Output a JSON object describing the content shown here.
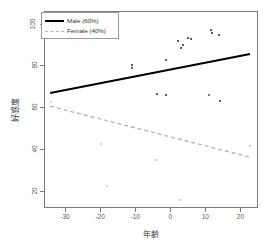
{
  "chart_data": {
    "type": "scatter",
    "title": "",
    "xlabel": "年齢",
    "ylabel": "好感度",
    "xlim": [
      -36,
      25
    ],
    "ylim": [
      12,
      106
    ],
    "xticks": [
      -30,
      -20,
      -10,
      0,
      10,
      20
    ],
    "yticks": [
      20,
      40,
      60,
      80,
      100
    ],
    "grid": false,
    "legend_position": "top-left",
    "series": [
      {
        "name": "Male (60%)",
        "color": "#000000",
        "linestyle": "solid",
        "points": [
          {
            "x": -11.2,
            "y": 80.6
          },
          {
            "x": -11.2,
            "y": 79.4
          },
          {
            "x": -4.0,
            "y": 67.0
          },
          {
            "x": -1.6,
            "y": 66.2
          },
          {
            "x": -1.4,
            "y": 83.2
          },
          {
            "x": 2.0,
            "y": 92.0
          },
          {
            "x": 2.8,
            "y": 88.8
          },
          {
            "x": 3.2,
            "y": 90.4
          },
          {
            "x": 4.8,
            "y": 93.4
          },
          {
            "x": 5.6,
            "y": 93.0
          },
          {
            "x": 10.8,
            "y": 66.2
          },
          {
            "x": 11.2,
            "y": 97.4
          },
          {
            "x": 11.6,
            "y": 96.2
          },
          {
            "x": 13.6,
            "y": 95.2
          },
          {
            "x": 13.8,
            "y": 63.4
          }
        ],
        "fit_line": {
          "x0": -34.5,
          "y0": 67.0,
          "x1": 23.0,
          "y1": 85.8
        }
      },
      {
        "name": "Female (40%)",
        "color": "#b4b4b4",
        "linestyle": "dashed",
        "points": [
          {
            "x": -34.2,
            "y": 63.2
          },
          {
            "x": -20.0,
            "y": 43.0
          },
          {
            "x": -18.4,
            "y": 23.2
          },
          {
            "x": -4.4,
            "y": 35.2
          },
          {
            "x": 2.4,
            "y": 16.2
          },
          {
            "x": 11.0,
            "y": 66.4
          },
          {
            "x": 22.4,
            "y": 42.2
          }
        ],
        "fit_line": {
          "x0": -34.5,
          "y0": 60.6,
          "x1": 23.0,
          "y1": 36.0
        }
      }
    ]
  },
  "legend": {
    "entries": [
      {
        "label": "Male (60%)"
      },
      {
        "label": "Female (40%)"
      }
    ]
  }
}
